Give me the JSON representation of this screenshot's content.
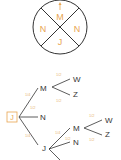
{
  "spinner": {
    "sections": [
      "M",
      "N",
      "J",
      "N"
    ],
    "pointer": "arrow-up",
    "color": "#e8a552"
  },
  "tree": {
    "root": "J",
    "level1": [
      {
        "label": "M",
        "prob": "1/4"
      },
      {
        "label": "N",
        "prob": "1/2"
      },
      {
        "label": "J",
        "prob": "1/4"
      }
    ],
    "m_children": [
      {
        "label": "W",
        "prob": "1/2"
      },
      {
        "label": "Z",
        "prob": "1/2"
      }
    ],
    "j_children": [
      {
        "label": "M",
        "prob": "1/4"
      },
      {
        "label": "N",
        "prob": "1/2"
      }
    ],
    "jm_children": [
      {
        "label": "W",
        "prob": "1/2"
      },
      {
        "label": "Z",
        "prob": "1/2"
      }
    ]
  }
}
